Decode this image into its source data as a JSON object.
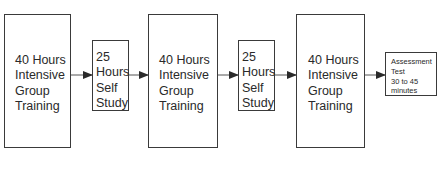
{
  "diagram": {
    "type": "flow",
    "direction": "left-to-right",
    "nodes": [
      {
        "id": "n1",
        "label": "40 Hours\nIntensive\nGroup\nTraining"
      },
      {
        "id": "n2",
        "label": "25\nHours\nSelf\nStudy"
      },
      {
        "id": "n3",
        "label": "40 Hours\nIntensive\nGroup\nTraining"
      },
      {
        "id": "n4",
        "label": "25\nHours\nSelf\nStudy"
      },
      {
        "id": "n5",
        "label": "40 Hours\nIntensive\nGroup\nTraining"
      },
      {
        "id": "n6",
        "label": "Assessment\nTest\n30 to 45\nminutes"
      }
    ],
    "edges": [
      {
        "from": "n1",
        "to": "n2"
      },
      {
        "from": "n2",
        "to": "n3"
      },
      {
        "from": "n3",
        "to": "n4"
      },
      {
        "from": "n4",
        "to": "n5"
      },
      {
        "from": "n5",
        "to": "n6"
      }
    ]
  },
  "colors": {
    "stroke": "#3a3a3a",
    "text": "#2a2a2a",
    "background": "#ffffff"
  }
}
